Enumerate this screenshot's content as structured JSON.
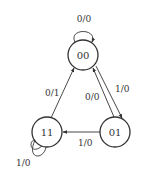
{
  "diagram": {
    "type": "state-transition",
    "states": [
      {
        "id": "s00",
        "label": "00",
        "cx": 83,
        "cy": 55
      },
      {
        "id": "s01",
        "label": "01",
        "cx": 115,
        "cy": 132
      },
      {
        "id": "s11",
        "label": "11",
        "cx": 47,
        "cy": 132
      }
    ],
    "transitions": [
      {
        "from": "00",
        "to": "00",
        "label": "0/0"
      },
      {
        "from": "00",
        "to": "01",
        "label": "1/0"
      },
      {
        "from": "01",
        "to": "00",
        "label": "0/0"
      },
      {
        "from": "01",
        "to": "11",
        "label": "1/0"
      },
      {
        "from": "11",
        "to": "00",
        "label": "0/1"
      },
      {
        "from": "11",
        "to": "11",
        "label": "1/0"
      }
    ],
    "colors": {
      "stroke": "#333333",
      "background": "#ffffff"
    }
  }
}
